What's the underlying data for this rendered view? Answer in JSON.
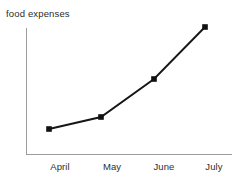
{
  "chart_data": {
    "type": "line",
    "title": "food expenses",
    "xlabel": "",
    "ylabel": "",
    "categories": [
      "April",
      "May",
      "June",
      "July"
    ],
    "values": [
      22,
      29,
      52,
      81
    ],
    "series": [
      {
        "name": "food expenses",
        "values": [
          22,
          29,
          52,
          81
        ]
      }
    ],
    "ylim": [
      0,
      100
    ],
    "grid": false,
    "legend": false,
    "legend_position": "none",
    "y_axis_ticks_visible": false,
    "marker": "square",
    "annotations": []
  },
  "style": {
    "line_color": "#161616",
    "marker_color": "#111111",
    "axis_color": "#9c9c9c",
    "text_color": "#2e2e2e",
    "title_color": "#2b2b2b",
    "background": "#ffffff"
  },
  "geometry": {
    "points": [
      {
        "label": "April",
        "cx": 49,
        "cy": 129,
        "tick_x": 60
      },
      {
        "label": "May",
        "cx": 101,
        "cy": 117,
        "tick_x": 112
      },
      {
        "label": "June",
        "cx": 154,
        "cy": 79,
        "tick_x": 164
      },
      {
        "label": "July",
        "cx": 205,
        "cy": 27,
        "tick_x": 214
      }
    ],
    "axis": {
      "x_start": 26,
      "x_end": 232,
      "y_baseline": 154,
      "y_top": 28
    },
    "marker_size": 5.6,
    "tick_label_y": 161
  }
}
